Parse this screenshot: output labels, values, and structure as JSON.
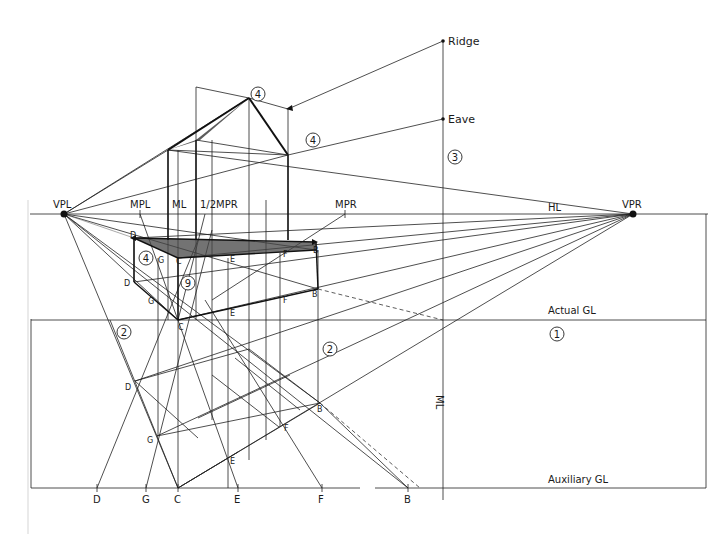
{
  "diagram": {
    "type": "two-point perspective construction of a gabled house",
    "horizon": {
      "label": "HL",
      "vanishing_points": [
        {
          "id": "VPL",
          "label": "VPL",
          "x": 64,
          "y": 214
        },
        {
          "id": "VPR",
          "label": "VPR",
          "x": 633,
          "y": 214
        }
      ],
      "measuring_points": [
        {
          "id": "MPL",
          "label": "MPL",
          "x": 140
        },
        {
          "id": "ML",
          "label": "ML",
          "x": 178
        },
        {
          "id": "HALFMPR",
          "label": "1/2MPR",
          "x": 205
        },
        {
          "id": "MPR",
          "label": "MPR",
          "x": 345
        }
      ]
    },
    "ground_lines": {
      "actual": {
        "label": "Actual GL",
        "y": 320
      },
      "auxiliary": {
        "label": "Auxiliary GL",
        "y": 488
      }
    },
    "vertical_measuring_line": {
      "label": "ML",
      "x": 443
    },
    "height_marks": [
      {
        "label": "Ridge",
        "y": 41
      },
      {
        "label": "Eave",
        "y": 119
      }
    ],
    "step_markers": [
      {
        "label": "1",
        "x": 557,
        "y": 334
      },
      {
        "label": "2",
        "x": 124,
        "y": 332
      },
      {
        "label": "2",
        "x": 330,
        "y": 349
      },
      {
        "label": "3",
        "x": 455,
        "y": 157
      },
      {
        "label": "4",
        "x": 258,
        "y": 94
      },
      {
        "label": "4",
        "x": 313,
        "y": 140
      },
      {
        "label": "4",
        "x": 146,
        "y": 258
      },
      {
        "label": "9",
        "x": 188,
        "y": 283
      }
    ],
    "auxiliary_points": [
      {
        "label": "D",
        "x": 97
      },
      {
        "label": "G",
        "x": 146
      },
      {
        "label": "C",
        "x": 178
      },
      {
        "label": "E",
        "x": 238
      },
      {
        "label": "F",
        "x": 322
      },
      {
        "label": "B",
        "x": 408
      }
    ],
    "plan_points": [
      {
        "label": "D",
        "x": 135,
        "y": 381
      },
      {
        "label": "G",
        "x": 157,
        "y": 436
      },
      {
        "label": "E",
        "x": 227,
        "y": 459
      },
      {
        "label": "F",
        "x": 279,
        "y": 427
      },
      {
        "label": "B",
        "x": 320,
        "y": 403
      }
    ],
    "box_points_ground": [
      {
        "label": "D",
        "x": 134,
        "y": 282
      },
      {
        "label": "G",
        "x": 158,
        "y": 300
      },
      {
        "label": "C",
        "x": 178,
        "y": 320
      },
      {
        "label": "E",
        "x": 228,
        "y": 310
      },
      {
        "label": "F",
        "x": 280,
        "y": 299
      },
      {
        "label": "B",
        "x": 318,
        "y": 289
      }
    ],
    "box_points_top": [
      {
        "label": "D",
        "x": 134,
        "y": 238
      },
      {
        "label": "G",
        "x": 160,
        "y": 258
      },
      {
        "label": "C",
        "x": 178,
        "y": 258
      },
      {
        "label": "E",
        "x": 228,
        "y": 258
      },
      {
        "label": "F",
        "x": 282,
        "y": 253
      },
      {
        "label": "B",
        "x": 316,
        "y": 250
      }
    ],
    "ridge_peak": {
      "x": 249,
      "y": 98
    },
    "eave_corner": {
      "x": 288,
      "y": 155
    }
  }
}
